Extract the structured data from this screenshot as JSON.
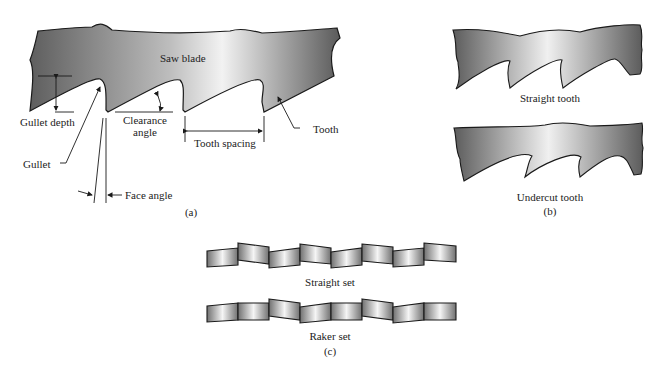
{
  "figure": {
    "panel_a": {
      "caption": "(a)",
      "labels": {
        "saw_blade": "Saw blade",
        "gullet_depth": "Gullet depth",
        "clearance_angle_1": "Clearance",
        "clearance_angle_2": "angle",
        "tooth_spacing": "Tooth spacing",
        "tooth": "Tooth",
        "gullet": "Gullet",
        "face_angle": "Face angle"
      }
    },
    "panel_b": {
      "caption": "(b)",
      "labels": {
        "straight_tooth": "Straight tooth",
        "undercut_tooth": "Undercut tooth"
      }
    },
    "panel_c": {
      "caption": "(c)",
      "labels": {
        "straight_set": "Straight set",
        "raker_set": "Raker set"
      }
    }
  },
  "colors": {
    "blade_dark": "#6a6a6a",
    "blade_light": "#f4f4f4",
    "outline": "#1a1a1a"
  }
}
